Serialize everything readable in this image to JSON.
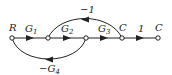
{
  "diagram": {
    "type": "signal-flow-graph",
    "nodes": [
      {
        "id": "n1",
        "label": "R",
        "x": 12,
        "y": 38
      },
      {
        "id": "n2",
        "label": "",
        "x": 48,
        "y": 38
      },
      {
        "id": "n3",
        "label": "",
        "x": 86,
        "y": 38
      },
      {
        "id": "n4",
        "label": "C",
        "x": 122,
        "y": 38
      },
      {
        "id": "n5",
        "label": "C",
        "x": 158,
        "y": 38
      }
    ],
    "edges": [
      {
        "from": "n1",
        "to": "n2",
        "gain": "G1",
        "label_main": "G",
        "label_sub": "1"
      },
      {
        "from": "n2",
        "to": "n3",
        "gain": "G2",
        "label_main": "G",
        "label_sub": "2"
      },
      {
        "from": "n3",
        "to": "n4",
        "gain": "G3",
        "label_main": "G",
        "label_sub": "3"
      },
      {
        "from": "n4",
        "to": "n5",
        "gain": "1",
        "label_main": "1",
        "label_sub": ""
      },
      {
        "from": "n4",
        "to": "n2",
        "gain": "-1",
        "label_main": "−1",
        "label_sub": ""
      },
      {
        "from": "n3",
        "to": "n1",
        "gain": "-G4",
        "label_main": "−G",
        "label_sub": "4"
      }
    ]
  }
}
